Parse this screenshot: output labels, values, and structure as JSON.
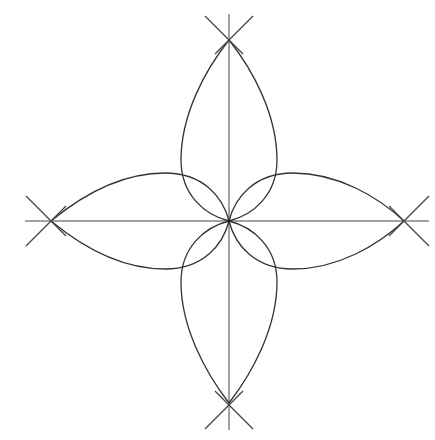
{
  "figure": {
    "colors": {
      "background": "#ffffff",
      "stroke": "#333333"
    },
    "center": [
      229,
      221
    ],
    "petal_tips": {
      "top": [
        229,
        40
      ],
      "bottom": [
        229,
        403
      ],
      "left": [
        51,
        221
      ],
      "right": [
        404,
        221
      ]
    },
    "petal_half_width": 48,
    "labels": []
  }
}
